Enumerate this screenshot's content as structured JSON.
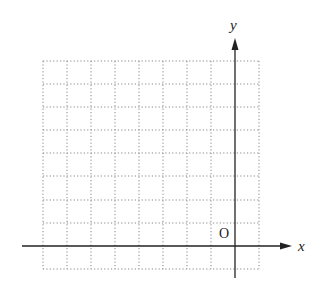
{
  "diagram": {
    "type": "coordinate-grid",
    "axes": {
      "x_label": "x",
      "y_label": "y",
      "origin_label": "O"
    },
    "grid": {
      "columns": 10,
      "rows": 9,
      "origin_column_index": 8,
      "origin_row_index_from_bottom": 1,
      "line_style": "dotted",
      "line_color": "#888888"
    },
    "colors": {
      "axis": "#222222",
      "background": "#ffffff"
    }
  }
}
